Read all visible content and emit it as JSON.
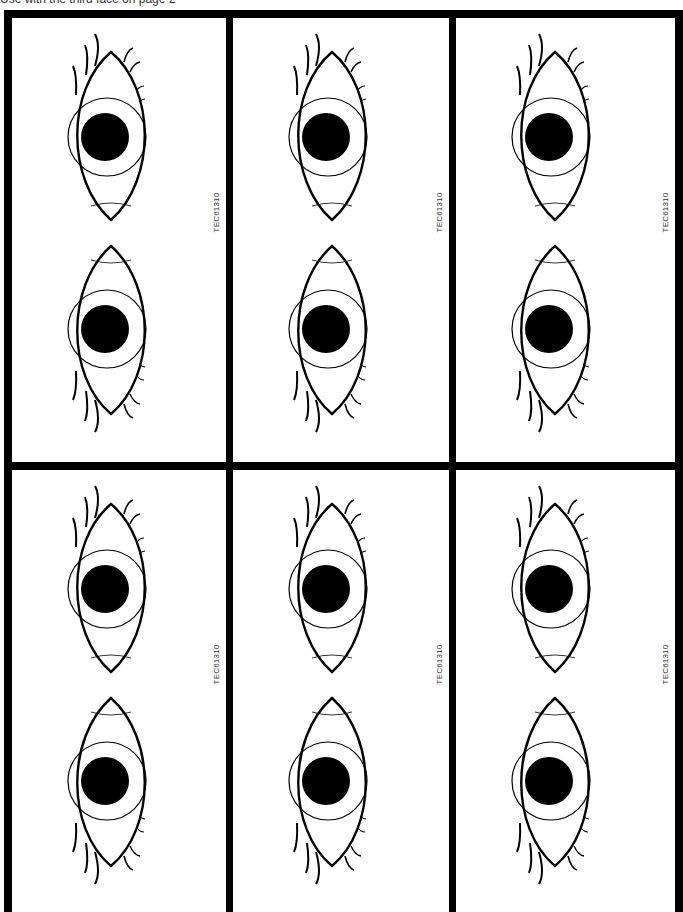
{
  "caption": "Use with the third face on page 2",
  "layout": {
    "columns": 3,
    "rows": 2
  },
  "panels": [
    {
      "label": "TEC61310",
      "eyes": [
        "eye-upper",
        "eye-lower"
      ]
    },
    {
      "label": "TEC61310",
      "eyes": [
        "eye-upper",
        "eye-lower"
      ]
    },
    {
      "label": "TEC61310",
      "eyes": [
        "eye-upper",
        "eye-lower"
      ]
    },
    {
      "label": "TEC61310",
      "eyes": [
        "eye-upper",
        "eye-lower"
      ]
    },
    {
      "label": "TEC61310",
      "eyes": [
        "eye-upper",
        "eye-lower"
      ]
    },
    {
      "label": "TEC61310",
      "eyes": [
        "eye-upper",
        "eye-lower"
      ]
    }
  ],
  "colors": {
    "border": "#000000",
    "background": "#ffffff",
    "pupil": "#000000"
  }
}
